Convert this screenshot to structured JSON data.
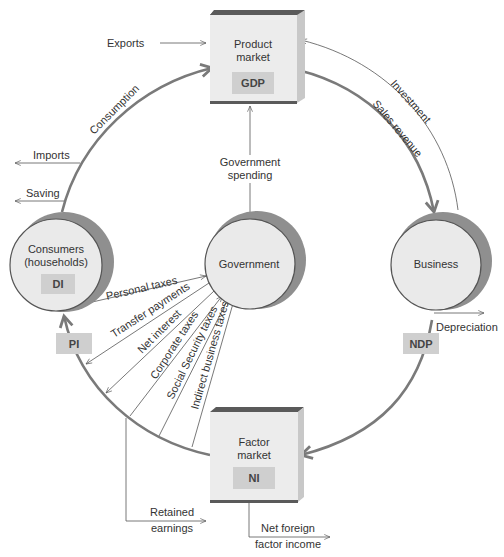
{
  "diagram": {
    "type": "circular-flow",
    "nodes": {
      "product_market": {
        "label_line1": "Product",
        "label_line2": "market",
        "badge": "GDP"
      },
      "factor_market": {
        "label_line1": "Factor",
        "label_line2": "market",
        "badge": "NI"
      },
      "consumers": {
        "label_line1": "Consumers",
        "label_line2": "(households)",
        "badge": "DI"
      },
      "government": {
        "label": "Government"
      },
      "business": {
        "label": "Business"
      }
    },
    "ring_badges": {
      "pi": "PI",
      "ndp": "NDP"
    },
    "flows": {
      "exports": "Exports",
      "imports": "Imports",
      "saving": "Saving",
      "consumption": "Consumption",
      "investment": "Investment",
      "sales_revenue": "Sales revenue",
      "government_spending_line1": "Government",
      "government_spending_line2": "spending",
      "depreciation": "Depreciation",
      "personal_taxes": "Personal taxes",
      "transfer_payments": "Transfer payments",
      "net_interest": "Net interest",
      "corporate_taxes": "Corporate taxes",
      "social_security_taxes": "Social Security taxes",
      "indirect_business_taxes": "Indirect business taxes",
      "retained_earnings_line1": "Retained",
      "retained_earnings_line2": "earnings",
      "net_foreign_line1": "Net foreign",
      "net_foreign_line2": "factor income"
    },
    "colors": {
      "ring": "#7a7a7a",
      "node_face": "#eaeaea",
      "node_shadow": "#8f8f8f",
      "badge": "#cfcfcf",
      "box_top": "#5a5a5a"
    }
  }
}
